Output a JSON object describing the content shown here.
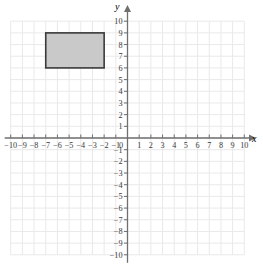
{
  "figure": {
    "kind": "cartesian-coordinate-plane",
    "background_color": "#ffffff",
    "grid_color": "#e9e9e9",
    "axis_color": "#6f6f6f",
    "tick_label_color": "#3a3a3a"
  },
  "axes": {
    "x": {
      "label": "x",
      "min": -10,
      "max": 10,
      "step": 1,
      "arrow": "right",
      "tick_labels": [
        "-10",
        "-9",
        "-8",
        "-7",
        "-6",
        "-5",
        "-4",
        "-3",
        "-2",
        "-1",
        "1",
        "2",
        "3",
        "4",
        "5",
        "6",
        "7",
        "8",
        "9",
        "10"
      ]
    },
    "y": {
      "label": "y",
      "min": -10,
      "max": 10,
      "step": 1,
      "arrow": "up",
      "tick_labels": [
        "10",
        "9",
        "8",
        "7",
        "6",
        "5",
        "4",
        "3",
        "2",
        "1",
        "-1",
        "-2",
        "-3",
        "-4",
        "-5",
        "-6",
        "-7",
        "-8",
        "-9",
        "-10"
      ]
    },
    "origin_label": "0"
  },
  "chart_data": {
    "type": "scatter",
    "title": "",
    "xlabel": "x",
    "ylabel": "y",
    "xlim": [
      -10,
      10
    ],
    "ylim": [
      -10,
      10
    ],
    "grid": true,
    "legend": "none",
    "shapes": [
      {
        "name": "shaded-rectangle",
        "type": "rectangle",
        "x_min": -7,
        "x_max": -2,
        "y_min": 6,
        "y_max": 9,
        "width": 5,
        "height": 3,
        "vertices": [
          [
            -7,
            9
          ],
          [
            -2,
            9
          ],
          [
            -2,
            6
          ],
          [
            -7,
            6
          ]
        ],
        "fill": "#c9c9c9",
        "stroke": "#3a3a3a",
        "stroke_width": 1.6
      }
    ]
  }
}
